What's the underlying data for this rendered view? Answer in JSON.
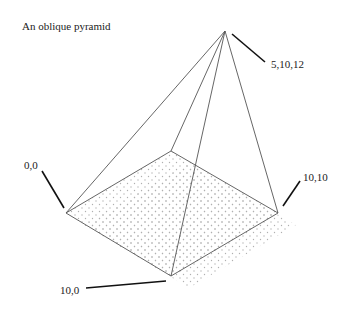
{
  "title": "An oblique pyramid",
  "vertices": {
    "apex": {
      "label": "5,10,12",
      "x": 225,
      "y": 31
    },
    "v00": {
      "label": "0,0",
      "x": 66,
      "y": 213
    },
    "v100": {
      "label": "10,0",
      "x": 171,
      "y": 276
    },
    "v1010": {
      "label": "10,10",
      "x": 278,
      "y": 213
    },
    "v010": {
      "x": 171,
      "y": 151
    }
  },
  "colors": {
    "edge": "#555555",
    "leader": "#111111",
    "dots": "#b0b0b0",
    "text": "#222222"
  }
}
